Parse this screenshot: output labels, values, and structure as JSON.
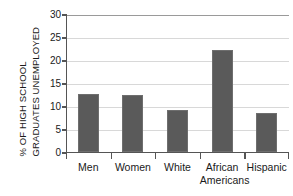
{
  "chart_data": {
    "type": "bar",
    "title": "",
    "xlabel": "",
    "ylabel": "% OF HIGH SCHOOL GRADUATES UNEMPLOYED",
    "ylabel_lines": [
      "% OF HIGH SCHOOL",
      "GRADUATES UNEMPLOYED"
    ],
    "categories": [
      "Men",
      "Women",
      "White",
      "African Americans",
      "Hispanic"
    ],
    "category_label_lines": [
      [
        "Men"
      ],
      [
        "Women"
      ],
      [
        "White"
      ],
      [
        "African",
        "Americans"
      ],
      [
        "Hispanic"
      ]
    ],
    "values": [
      12.7,
      12.4,
      9.2,
      22.2,
      8.4
    ],
    "ylim": [
      0,
      30
    ],
    "yticks": [
      0,
      5,
      10,
      15,
      20,
      25,
      30
    ],
    "ytick_labels": [
      "0",
      "5",
      "10",
      "15",
      "20",
      "25",
      "30"
    ],
    "grid": true,
    "grid_axis": "y",
    "legend": "none",
    "bar_color": "#5a5a5a",
    "grid_color": "#d8d8d8",
    "axis_color": "#555555",
    "background_color": "#ffffff"
  }
}
